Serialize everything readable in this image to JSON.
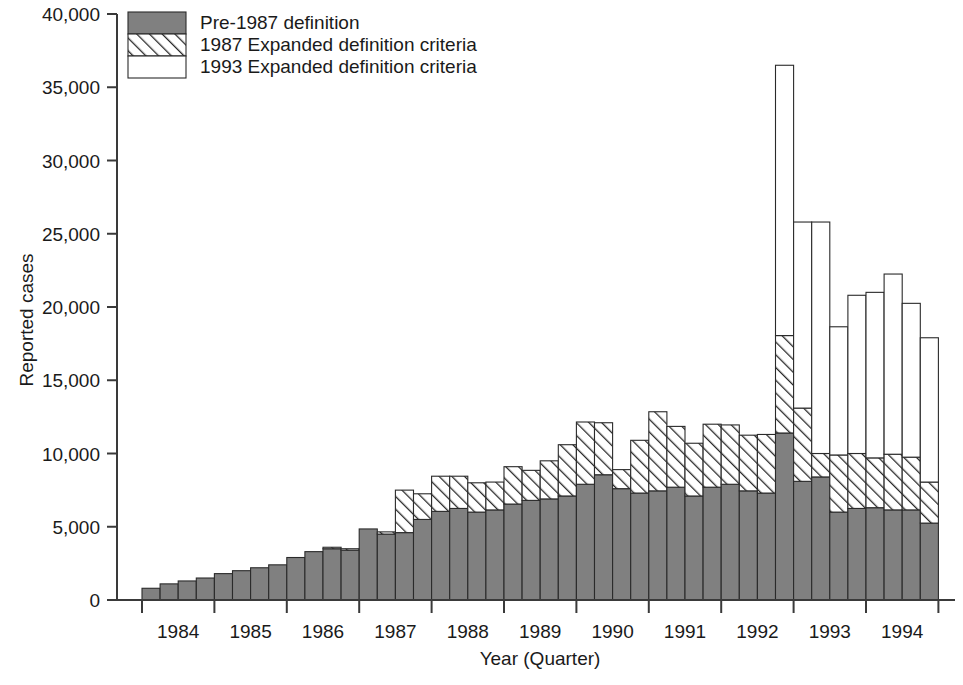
{
  "chart_data": {
    "type": "bar",
    "subtype": "stacked-bar",
    "title": "",
    "xlabel": "Year (Quarter)",
    "ylabel": "Reported cases",
    "ylim": [
      0,
      40000
    ],
    "ytick_values": [
      0,
      5000,
      10000,
      15000,
      20000,
      25000,
      30000,
      35000,
      40000
    ],
    "ytick_labels": [
      "0",
      "5,000",
      "10,000",
      "15,000",
      "20,000",
      "25,000",
      "30,000",
      "35,000",
      "40,000"
    ],
    "xtick_labels": [
      "1984",
      "1985",
      "1986",
      "1987",
      "1988",
      "1989",
      "1990",
      "1991",
      "1992",
      "1993",
      "1994"
    ],
    "grid": false,
    "legend_position": "top-left",
    "legend": [
      {
        "label": "Pre-1987 definition",
        "pattern": "solid-gray",
        "color": "#808080"
      },
      {
        "label": "1987 Expanded definition criteria",
        "pattern": "diagonal-hatch",
        "color": "#ffffff"
      },
      {
        "label": "1993 Expanded definition criteria",
        "pattern": "open-white",
        "color": "#ffffff"
      }
    ],
    "categories": [
      "1984 Q1",
      "1984 Q2",
      "1984 Q3",
      "1984 Q4",
      "1985 Q1",
      "1985 Q2",
      "1985 Q3",
      "1985 Q4",
      "1986 Q1",
      "1986 Q2",
      "1986 Q3",
      "1986 Q4",
      "1987 Q1",
      "1987 Q2",
      "1987 Q3",
      "1987 Q4",
      "1988 Q1",
      "1988 Q2",
      "1988 Q3",
      "1988 Q4",
      "1989 Q1",
      "1989 Q2",
      "1989 Q3",
      "1989 Q4",
      "1990 Q1",
      "1990 Q2",
      "1990 Q3",
      "1990 Q4",
      "1991 Q1",
      "1991 Q2",
      "1991 Q3",
      "1991 Q4",
      "1992 Q1",
      "1992 Q2",
      "1992 Q3",
      "1992 Q4",
      "1993 Q1",
      "1993 Q2",
      "1993 Q3",
      "1993 Q4",
      "1994 Q1",
      "1994 Q2",
      "1994 Q3",
      "1994 Q4"
    ],
    "series": [
      {
        "name": "Pre-1987 definition",
        "pattern": "solid-gray",
        "values": [
          800,
          1100,
          1300,
          1500,
          1800,
          2000,
          2200,
          2400,
          2900,
          3300,
          3500,
          3400,
          4850,
          4500,
          4600,
          5500,
          6050,
          6250,
          6000,
          6150,
          6550,
          6800,
          6900,
          7100,
          7900,
          8550,
          7600,
          7300,
          7450,
          7700,
          7100,
          7700,
          7900,
          7450,
          7300,
          11400,
          8100,
          8400,
          6000,
          6250,
          6300,
          6150,
          6150,
          5250
        ]
      },
      {
        "name": "1987 Expanded definition criteria",
        "pattern": "diagonal-hatch",
        "values": [
          0,
          0,
          0,
          0,
          0,
          0,
          0,
          0,
          0,
          0,
          100,
          100,
          0,
          150,
          2900,
          1750,
          2400,
          2200,
          2000,
          1900,
          2550,
          2050,
          2600,
          3500,
          4250,
          3550,
          1300,
          3600,
          5400,
          4150,
          3600,
          4300,
          4050,
          3800,
          4000,
          6650,
          5000,
          1600,
          3900,
          3750,
          3400,
          3800,
          3600,
          2800
        ]
      },
      {
        "name": "1993 Expanded definition criteria",
        "pattern": "open-white",
        "values": [
          0,
          0,
          0,
          0,
          0,
          0,
          0,
          0,
          0,
          0,
          0,
          0,
          0,
          0,
          0,
          0,
          0,
          0,
          0,
          0,
          0,
          0,
          0,
          0,
          0,
          0,
          0,
          0,
          0,
          0,
          0,
          0,
          0,
          0,
          0,
          18450,
          12700,
          15800,
          8750,
          10800,
          11300,
          12300,
          10500,
          9850
        ]
      }
    ],
    "totals": [
      800,
      1100,
      1300,
      1500,
      1800,
      2000,
      2200,
      2400,
      2900,
      3300,
      3600,
      3500,
      4850,
      4650,
      7500,
      7250,
      8450,
      8450,
      8000,
      8050,
      9100,
      8850,
      9500,
      10600,
      12150,
      12100,
      8900,
      10900,
      12850,
      11850,
      10700,
      12000,
      11950,
      11250,
      11300,
      36500,
      25800,
      25800,
      18650,
      20800,
      21000,
      22250,
      20250,
      17900
    ]
  },
  "axes": {
    "y_axis_title": "Reported cases",
    "x_axis_title": "Year (Quarter)"
  }
}
